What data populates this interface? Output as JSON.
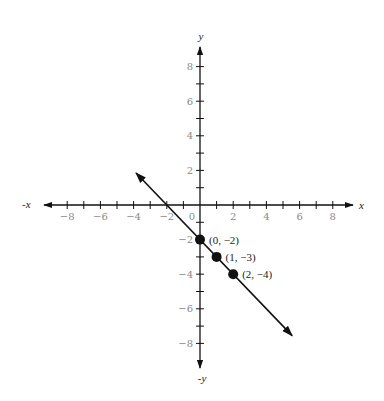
{
  "chart_data": {
    "type": "line",
    "title": "",
    "xlabel": "x",
    "xlabel_neg": "-x",
    "ylabel": "y",
    "ylabel_neg": "-y",
    "xlim": [
      -9,
      9
    ],
    "ylim": [
      -9,
      9
    ],
    "grid": false,
    "x_ticks": [
      -8,
      -7,
      -6,
      -5,
      -4,
      -3,
      -2,
      -1,
      1,
      2,
      3,
      4,
      5,
      6,
      7,
      8
    ],
    "y_ticks": [
      -8,
      -7,
      -6,
      -5,
      -4,
      -3,
      -2,
      -1,
      1,
      2,
      3,
      4,
      5,
      6,
      7,
      8
    ],
    "x_tick_labels": [
      "−8",
      "−6",
      "−4",
      "−2",
      "0",
      "2",
      "4",
      "6",
      "8"
    ],
    "x_tick_label_values": [
      -8,
      -6,
      -4,
      -2,
      0,
      2,
      4,
      6,
      8
    ],
    "y_tick_labels": [
      "8",
      "6",
      "4",
      "2",
      "−2",
      "−4",
      "−6",
      "−8"
    ],
    "y_tick_label_values": [
      8,
      6,
      4,
      2,
      -2,
      -4,
      -6,
      -8
    ],
    "series": [
      {
        "name": "y = -x - 2",
        "line": {
          "x": [
            -3.85,
            5.55
          ],
          "y": [
            1.85,
            -7.55
          ],
          "arrows": "both"
        },
        "points": [
          {
            "x": 0,
            "y": -2,
            "label": "(0, −2)"
          },
          {
            "x": 1,
            "y": -3,
            "label": "(1, −3)"
          },
          {
            "x": 2,
            "y": -4,
            "label": "(2, −4)"
          }
        ]
      }
    ]
  },
  "colors": {
    "ink": "#111111",
    "tick_label": "#888888"
  }
}
